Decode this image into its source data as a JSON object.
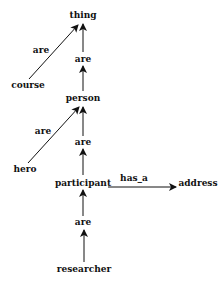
{
  "diagram": {
    "type": "semantic-network",
    "nodes": [
      {
        "id": "thing",
        "label": "thing",
        "x": 83,
        "y": 17
      },
      {
        "id": "course",
        "label": "course",
        "x": 28,
        "y": 86
      },
      {
        "id": "person",
        "label": "person",
        "x": 83,
        "y": 100
      },
      {
        "id": "hero",
        "label": "hero",
        "x": 25,
        "y": 170
      },
      {
        "id": "participant",
        "label": "participant",
        "x": 83,
        "y": 184
      },
      {
        "id": "address",
        "label": "address",
        "x": 198,
        "y": 184
      },
      {
        "id": "researcher",
        "label": "researcher",
        "x": 84,
        "y": 272
      }
    ],
    "edges": [
      {
        "from": "course",
        "to": "thing",
        "label": "are"
      },
      {
        "from": "person",
        "to": "thing",
        "label": "are"
      },
      {
        "from": "hero",
        "to": "person",
        "label": "are"
      },
      {
        "from": "participant",
        "to": "person",
        "label": "are"
      },
      {
        "from": "participant",
        "to": "address",
        "label": "has_a"
      },
      {
        "from": "researcher",
        "to": "participant",
        "label": "are"
      }
    ]
  }
}
